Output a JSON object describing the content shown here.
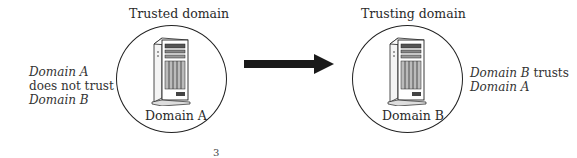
{
  "diagram": {
    "left": {
      "title": "Trusted domain",
      "domain_label": "Domain A",
      "note": {
        "line1_italic": "Domain A",
        "line2": "does not trust",
        "line3_italic": "Domain B"
      },
      "icon": "server-tower-icon"
    },
    "right": {
      "title": "Trusting domain",
      "domain_label": "Domain B",
      "note": {
        "line1_italic": "Domain B",
        "line1_rest": " trusts",
        "line2_italic": "Domain A"
      },
      "icon": "server-tower-icon"
    },
    "arrow": {
      "direction": "right",
      "from": "Domain A",
      "to": "Domain B",
      "icon": "arrow-right-icon",
      "color": "#1a1a1a"
    },
    "page_fragment": "3"
  }
}
